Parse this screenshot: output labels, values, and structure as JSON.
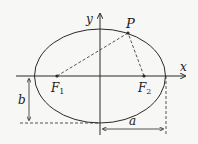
{
  "diagram": {
    "labels": {
      "x_axis": "x",
      "y_axis": "y",
      "point": "P",
      "focus1": "F",
      "focus1_sub": "1",
      "focus2": "F",
      "focus2_sub": "2",
      "semi_minor": "b",
      "semi_major": "a"
    },
    "colors": {
      "stroke": "#2a2a2a",
      "background": "#f7f7f5"
    }
  }
}
